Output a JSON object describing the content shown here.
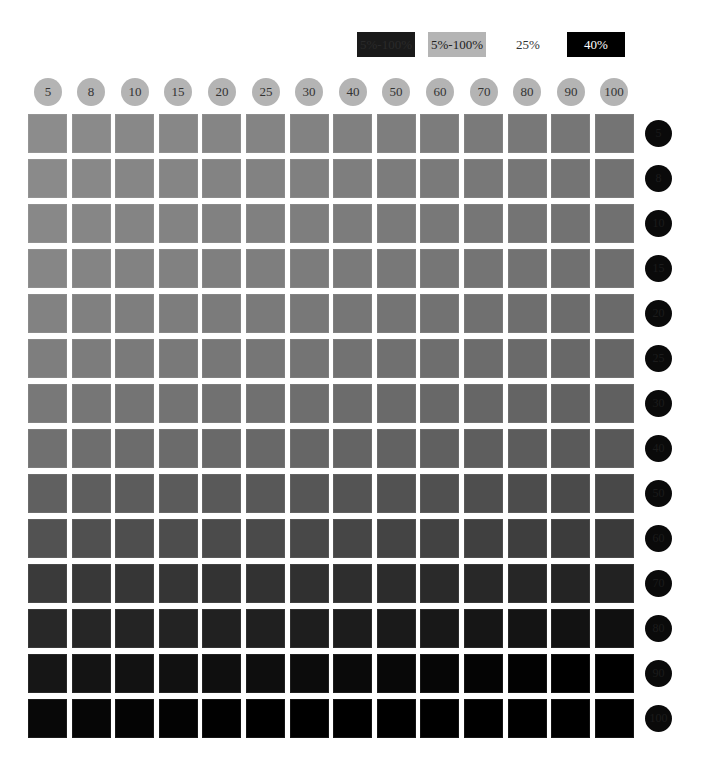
{
  "legend": [
    {
      "label": "5%-100%",
      "bg": "#1a1a1a",
      "fg": "#2a2a2a"
    },
    {
      "label": "5%-100%",
      "bg": "#b4b4b4",
      "fg": "#222222"
    },
    {
      "label": "25%",
      "bg": "#ffffff",
      "fg": "#333333"
    },
    {
      "label": "40%",
      "bg": "#000000",
      "fg": "#ffffff"
    }
  ],
  "columns": [
    "5",
    "8",
    "10",
    "15",
    "20",
    "25",
    "30",
    "40",
    "50",
    "60",
    "70",
    "80",
    "90",
    "100"
  ],
  "rows": [
    "5",
    "8",
    "10",
    "15",
    "20",
    "25",
    "30",
    "40",
    "50",
    "60",
    "70",
    "80",
    "90",
    "100"
  ],
  "chart_data": {
    "type": "heatmap",
    "title": "",
    "xlabel": "",
    "ylabel": "",
    "x": [
      "5",
      "8",
      "10",
      "15",
      "20",
      "25",
      "30",
      "40",
      "50",
      "60",
      "70",
      "80",
      "90",
      "100"
    ],
    "y": [
      "5",
      "8",
      "10",
      "15",
      "20",
      "25",
      "30",
      "40",
      "50",
      "60",
      "70",
      "80",
      "90",
      "100"
    ],
    "legend": [
      "5%-100%",
      "5%-100%",
      "25%",
      "40%"
    ],
    "row_base_gray": [
      140,
      138,
      136,
      134,
      130,
      126,
      120,
      112,
      96,
      82,
      58,
      40,
      22,
      8
    ],
    "col_darkening": [
      0,
      2,
      4,
      5,
      7,
      8,
      10,
      12,
      14,
      16,
      18,
      20,
      22,
      24
    ],
    "note": "cell gray = max(0, row_base_gray[r] - col_darkening[c]); darker toward bottom-right"
  }
}
